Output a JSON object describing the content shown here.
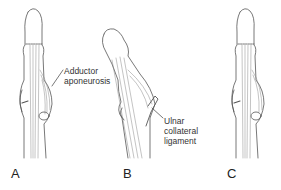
{
  "figure": {
    "panels": [
      {
        "id": "A",
        "label": "A"
      },
      {
        "id": "B",
        "label": "B"
      },
      {
        "id": "C",
        "label": "C"
      }
    ],
    "annotations": {
      "adductor_aponeurosis": {
        "line1": "Adductor",
        "line2": "aponeurosis"
      },
      "ulnar_collateral_ligament": {
        "line1": "Ulnar",
        "line2": "collateral",
        "line3": "ligament"
      }
    },
    "colors": {
      "line": "#555555",
      "hatch": "#888888",
      "text": "#333333"
    }
  }
}
